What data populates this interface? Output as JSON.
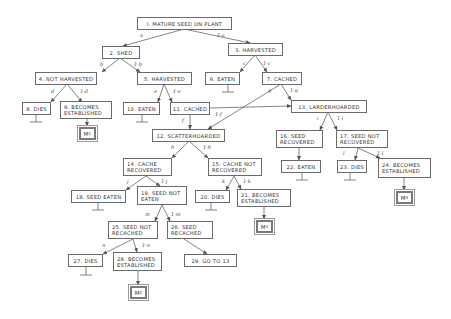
{
  "diagram": {
    "type": "probability-tree",
    "nodes": [
      {
        "id": "1",
        "label": "1. MATURE SEED ON PLANT",
        "lines": [
          "I. MATURE SEED ON PLANT"
        ]
      },
      {
        "id": "2",
        "label": "2. SHED",
        "lines": [
          "2. SHED"
        ]
      },
      {
        "id": "3",
        "label": "3. HARVESTED",
        "lines": [
          "3. HARVESTED"
        ]
      },
      {
        "id": "4",
        "label": "4. NOT HARVESTED",
        "lines": [
          "4. NOT HARVESTED"
        ]
      },
      {
        "id": "5",
        "label": "5. HARVESTED",
        "lines": [
          "5. HARVESTED"
        ]
      },
      {
        "id": "6",
        "label": "6. EATEN",
        "lines": [
          "6. EATEN"
        ]
      },
      {
        "id": "7",
        "label": "7. CACHED",
        "lines": [
          "7. CACHED"
        ]
      },
      {
        "id": "8",
        "label": "8. DIES",
        "lines": [
          "8. DIES"
        ]
      },
      {
        "id": "9",
        "label": "9. BECOMES ESTABLISHED",
        "lines": [
          "9. BECOMES",
          "ESTABLISHED"
        ]
      },
      {
        "id": "10",
        "label": "10. EATEN",
        "lines": [
          "10. EATEN"
        ]
      },
      {
        "id": "11",
        "label": "11. CACHED",
        "lines": [
          "11. CACHED"
        ]
      },
      {
        "id": "12",
        "label": "12. SCATTERHOARDED",
        "lines": [
          "12. SCATTERHOARDED"
        ]
      },
      {
        "id": "13",
        "label": "13. LARDERHOARDED",
        "lines": [
          "13. LARDERHOARDED"
        ]
      },
      {
        "id": "14",
        "label": "14. CACHE RECOVERED",
        "lines": [
          "14. CACHE",
          "RECOVERED"
        ]
      },
      {
        "id": "15",
        "label": "15. CACHE NOT RECOVERED",
        "lines": [
          "15. CACHE NOT",
          "RECOVERED"
        ]
      },
      {
        "id": "16",
        "label": "16. SEED RECOVERED",
        "lines": [
          "16. SEED",
          "RECOVERED"
        ]
      },
      {
        "id": "17",
        "label": "17. SEED NOT RECOVERED",
        "lines": [
          "17. SEED NOT",
          "RECOVERED"
        ]
      },
      {
        "id": "18",
        "label": "18. SEED EATEN",
        "lines": [
          "18. SEED EATEN"
        ]
      },
      {
        "id": "19",
        "label": "19. SEED NOT EATEN",
        "lines": [
          "19. SEED NOT",
          "EATEN"
        ]
      },
      {
        "id": "20",
        "label": "20. DIES",
        "lines": [
          "20. DIES"
        ]
      },
      {
        "id": "21",
        "label": "21. BECOMES ESTABLISHED",
        "lines": [
          "21. BECOMES",
          "ESTABLISHED"
        ]
      },
      {
        "id": "22",
        "label": "22. EATEN",
        "lines": [
          "22. EATEN"
        ]
      },
      {
        "id": "23",
        "label": "23. DIES",
        "lines": [
          "23. DIES"
        ]
      },
      {
        "id": "24",
        "label": "24. BECOMES ESTABLISHED",
        "lines": [
          "24. BECOMES",
          "ESTABLISHED"
        ]
      },
      {
        "id": "25",
        "label": "25. SEED NOT RECACHED",
        "lines": [
          "25. SEED NOT",
          "RECACHED"
        ]
      },
      {
        "id": "26",
        "label": "26. SEED RECACHED",
        "lines": [
          "26. SEED",
          "RECACHED"
        ]
      },
      {
        "id": "27",
        "label": "27. DIES",
        "lines": [
          "27. DIES"
        ]
      },
      {
        "id": "28",
        "label": "28. BECOMES ESTABLISHED",
        "lines": [
          "28. BECOMES",
          "ESTABLISHED"
        ]
      },
      {
        "id": "29",
        "label": "29. GO TO 13",
        "lines": [
          "29. GO TO 13"
        ]
      }
    ],
    "outcomes": [
      {
        "id": "M1",
        "label": "M",
        "sub": "1"
      },
      {
        "id": "M2",
        "label": "M",
        "sub": "2"
      },
      {
        "id": "M3",
        "label": "M",
        "sub": "3"
      },
      {
        "id": "M4",
        "label": "M",
        "sub": "4"
      }
    ],
    "edges": [
      {
        "from": "1",
        "to": "2",
        "label": "a"
      },
      {
        "from": "1",
        "to": "3",
        "label": "1-a"
      },
      {
        "from": "2",
        "to": "4",
        "label": "b"
      },
      {
        "from": "2",
        "to": "5",
        "label": "1-b"
      },
      {
        "from": "3",
        "to": "6",
        "label": "c"
      },
      {
        "from": "3",
        "to": "7",
        "label": "1-c"
      },
      {
        "from": "4",
        "to": "8",
        "label": "d"
      },
      {
        "from": "4",
        "to": "9",
        "label": "1-d"
      },
      {
        "from": "5",
        "to": "10",
        "label": "e"
      },
      {
        "from": "5",
        "to": "11",
        "label": "1-e"
      },
      {
        "from": "7",
        "to": "12",
        "label": "g"
      },
      {
        "from": "7",
        "to": "13",
        "label": "1-g"
      },
      {
        "from": "11",
        "to": "12",
        "label": "f"
      },
      {
        "from": "11",
        "to": "13",
        "label": "1-f"
      },
      {
        "from": "12",
        "to": "14",
        "label": "h"
      },
      {
        "from": "12",
        "to": "15",
        "label": "1-h"
      },
      {
        "from": "13",
        "to": "16",
        "label": "i"
      },
      {
        "from": "13",
        "to": "17",
        "label": "1-i"
      },
      {
        "from": "14",
        "to": "18",
        "label": "j"
      },
      {
        "from": "14",
        "to": "19",
        "label": "1-j"
      },
      {
        "from": "15",
        "to": "20",
        "label": "k"
      },
      {
        "from": "15",
        "to": "21",
        "label": "1-k"
      },
      {
        "from": "16",
        "to": "22",
        "label": ""
      },
      {
        "from": "17",
        "to": "23",
        "label": "l"
      },
      {
        "from": "17",
        "to": "24",
        "label": "1-l"
      },
      {
        "from": "19",
        "to": "25",
        "label": "m"
      },
      {
        "from": "19",
        "to": "26",
        "label": "1-m"
      },
      {
        "from": "25",
        "to": "27",
        "label": "n"
      },
      {
        "from": "25",
        "to": "28",
        "label": "1-n"
      },
      {
        "from": "26",
        "to": "29",
        "label": ""
      },
      {
        "from": "9",
        "to": "M1",
        "label": ""
      },
      {
        "from": "28",
        "to": "M2",
        "label": ""
      },
      {
        "from": "21",
        "to": "M3",
        "label": ""
      },
      {
        "from": "24",
        "to": "M4",
        "label": ""
      }
    ],
    "terminals": [
      "6",
      "8",
      "10",
      "18",
      "20",
      "22",
      "23",
      "27"
    ]
  }
}
